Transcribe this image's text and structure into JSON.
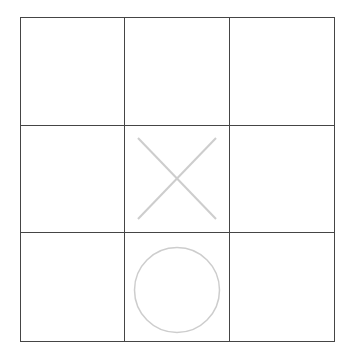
{
  "game": {
    "type": "tic-tac-toe",
    "board": {
      "rows": 3,
      "cols": 3,
      "cells": [
        "",
        "",
        "",
        "",
        "X",
        "",
        "",
        "O",
        ""
      ]
    },
    "marks": {
      "x_symbol": "X",
      "o_symbol": "O"
    },
    "colors": {
      "background": "#ffffff",
      "grid_line": "#454545",
      "x_mark": "#cdcdcd",
      "o_mark": "#cdcdcd"
    }
  }
}
